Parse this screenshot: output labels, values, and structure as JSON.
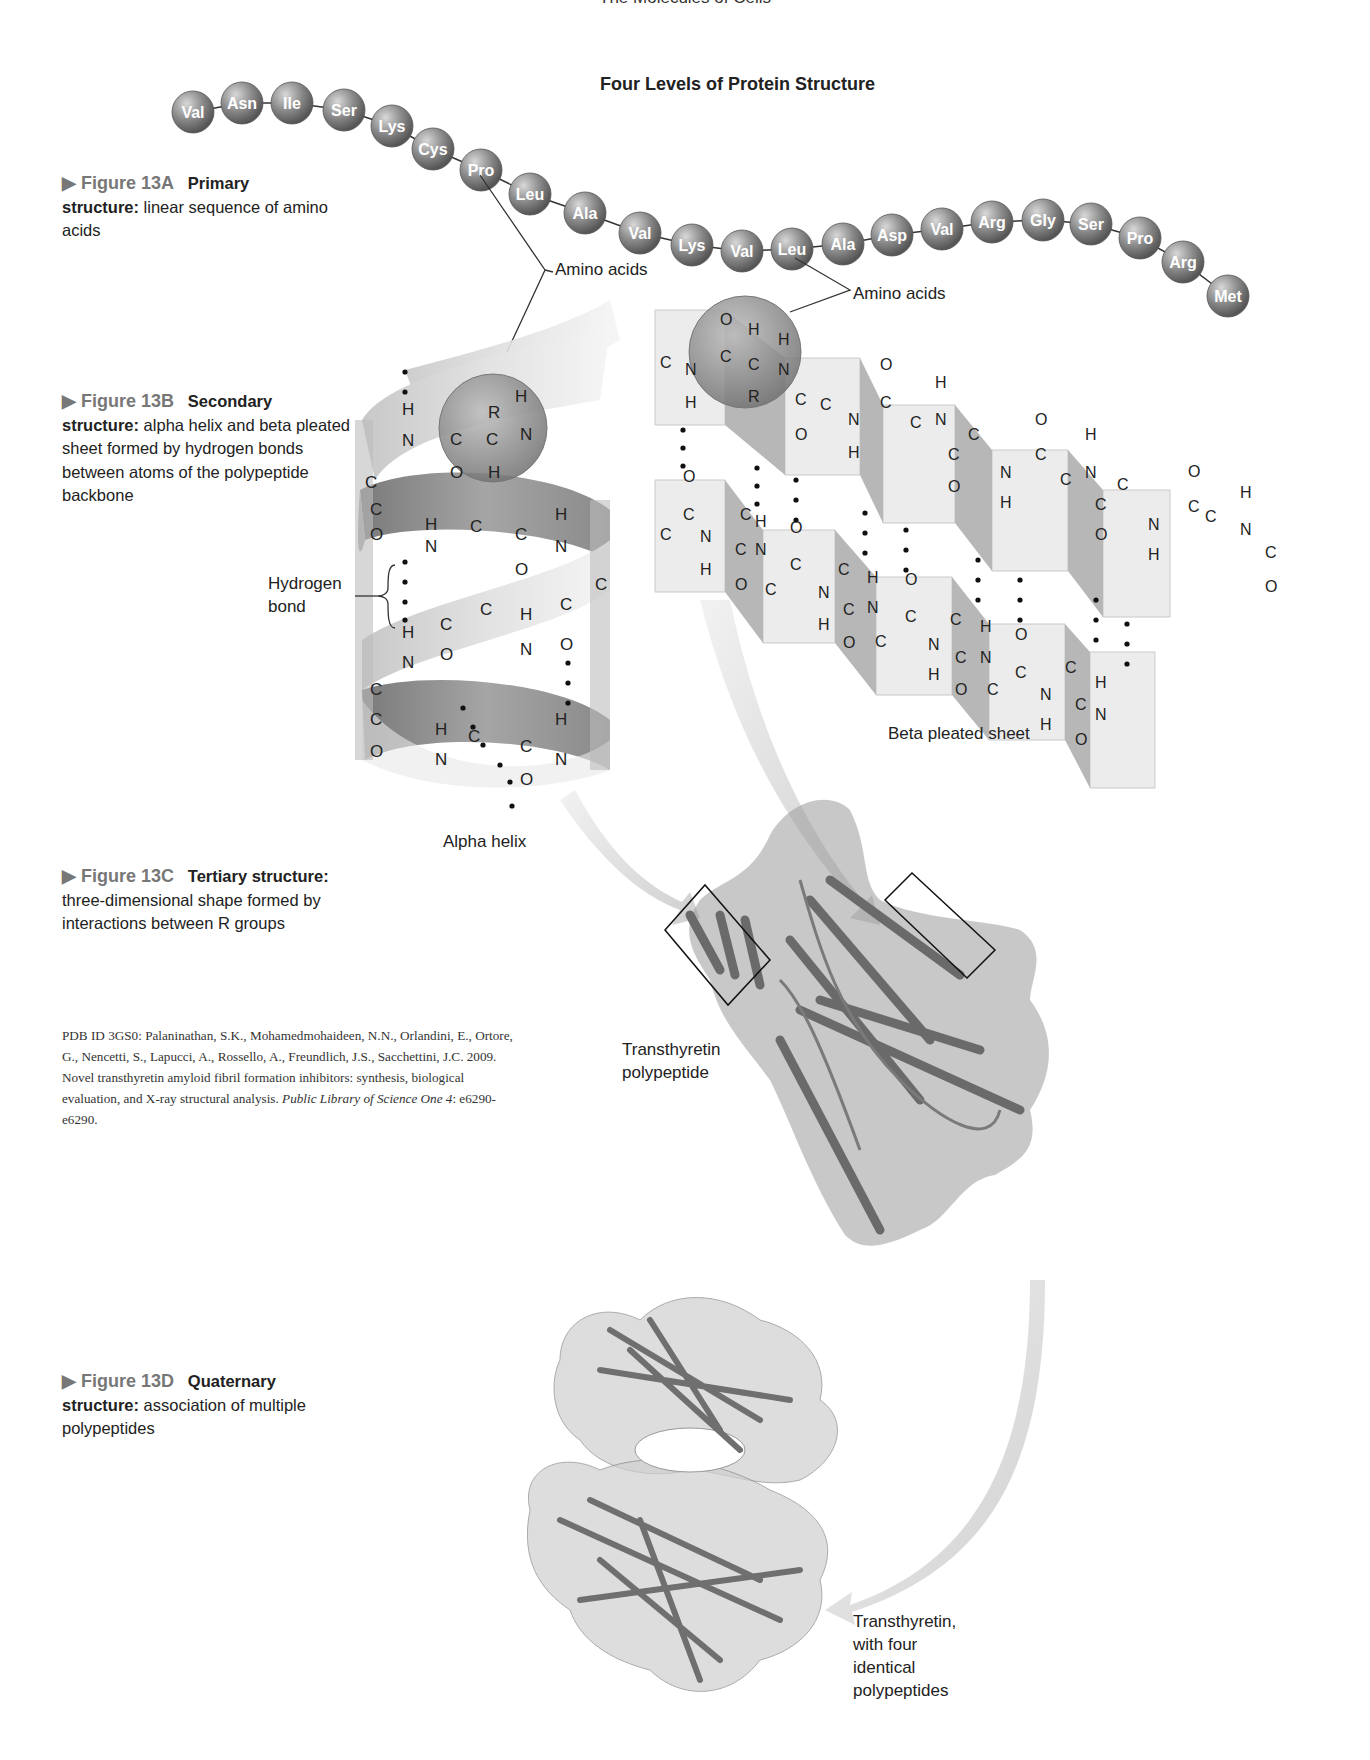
{
  "header": {
    "running_head": "The Molecules of Cells",
    "diagram_title": "Four Levels of Protein Structure"
  },
  "figures": [
    {
      "id": "13A",
      "number": "▶ Figure 13A",
      "title": "Primary",
      "title_cont": "structure:",
      "description": "linear sequence of amino acids"
    },
    {
      "id": "13B",
      "number": "▶ Figure 13B",
      "title": "Secondary",
      "title_cont": "structure:",
      "description": "alpha helix and beta pleated sheet formed by hydrogen bonds between atoms of the polypeptide backbone"
    },
    {
      "id": "13C",
      "number": "▶ Figure 13C",
      "title": "Tertiary structure:",
      "title_cont": "",
      "description": "three-dimensional shape formed by interactions between R groups"
    },
    {
      "id": "13D",
      "number": "▶ Figure 13D",
      "title": "Quaternary",
      "title_cont": "structure:",
      "description": "association of multiple polypeptides"
    }
  ],
  "amino_acid_chain": [
    "Val",
    "Asn",
    "Ile",
    "Ser",
    "Lys",
    "Cys",
    "Pro",
    "Leu",
    "Ala",
    "Val",
    "Lys",
    "Val",
    "Leu",
    "Ala",
    "Asp",
    "Val",
    "Arg",
    "Gly",
    "Ser",
    "Pro",
    "Arg",
    "Met"
  ],
  "labels": {
    "amino_acids_1": "Amino acids",
    "amino_acids_2": "Amino acids",
    "hydrogen_bond_line1": "Hydrogen",
    "hydrogen_bond_line2": "bond",
    "alpha_helix": "Alpha helix",
    "beta_sheet": "Beta pleated sheet",
    "transthyretin_poly_line1": "Transthyretin",
    "transthyretin_poly_line2": "polypeptide",
    "transthyretin_four_line1": "Transthyretin,",
    "transthyretin_four_line2": "with four",
    "transthyretin_four_line3": "identical",
    "transthyretin_four_line4": "polypeptides"
  },
  "citation": {
    "text": "PDB ID 3GS0: Palaninathan, S.K., Mohamedmohaideen, N.N., Orlandini, E., Ortore, G., Nencetti, S., Lapucci, A., Rossello, A., Freundlich, J.S., Sacchettini, J.C. 2009. Novel transthyretin amyloid fibril formation inhibitors: synthesis, biological evaluation, and X-ray structural analysis.",
    "journal": "Public Library of Science One 4",
    "pages": ": e6290-e6290."
  },
  "colors": {
    "sphere": "#8a8a8a",
    "ribbon": "#9a9a9a",
    "sheet_face": "#ececec",
    "sheet_side": "#b5b5b5",
    "arrow": "#d8d8d8"
  }
}
